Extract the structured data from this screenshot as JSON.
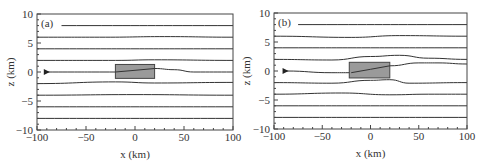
{
  "chart_data": [
    {
      "type": "line",
      "panel_label": "(a)",
      "xlabel": "x (km)",
      "ylabel": "z (km)",
      "xlim": [
        -100,
        100
      ],
      "ylim": [
        -10,
        10
      ],
      "xticks": [
        -100,
        -50,
        0,
        50,
        100
      ],
      "xtick_labels": [
        "−100",
        "−50",
        "0",
        "50",
        "100"
      ],
      "yticks": [
        -10,
        -5,
        0,
        5,
        10
      ],
      "ytick_labels": [
        "−10",
        "−5",
        "0",
        "5",
        "10"
      ],
      "grid": false,
      "obstacle": {
        "x0": -20,
        "x1": 20,
        "z0": -1.1,
        "z1": 1.3,
        "color": "#999999"
      },
      "source_marker": {
        "x": -90,
        "z": 0
      },
      "series": [
        {
          "name": "streamline z=8",
          "points": [
            [
              -75,
              8
            ],
            [
              100,
              8
            ]
          ]
        },
        {
          "name": "streamline z=6",
          "points": [
            [
              -100,
              6
            ],
            [
              -30,
              6
            ],
            [
              30,
              6.1
            ],
            [
              100,
              6
            ]
          ]
        },
        {
          "name": "streamline z=4",
          "points": [
            [
              -100,
              4
            ],
            [
              100,
              4
            ]
          ]
        },
        {
          "name": "streamline z=2",
          "points": [
            [
              -100,
              2
            ],
            [
              -20,
              2
            ],
            [
              20,
              2.1
            ],
            [
              100,
              2
            ]
          ]
        },
        {
          "name": "streamline z=0",
          "points": [
            [
              -90,
              0
            ],
            [
              -20,
              0
            ],
            [
              0,
              0.3
            ],
            [
              20,
              0.6
            ],
            [
              40,
              0.4
            ],
            [
              60,
              0
            ],
            [
              100,
              0
            ]
          ]
        },
        {
          "name": "streamline z=-2",
          "points": [
            [
              -100,
              -2
            ],
            [
              -20,
              -1.7
            ],
            [
              20,
              -1.9
            ],
            [
              100,
              -1.8
            ]
          ]
        },
        {
          "name": "streamline z=-4",
          "points": [
            [
              -100,
              -4
            ],
            [
              0,
              -3.9
            ],
            [
              100,
              -4
            ]
          ]
        },
        {
          "name": "streamline z=-6",
          "points": [
            [
              -100,
              -6
            ],
            [
              100,
              -6
            ]
          ]
        },
        {
          "name": "streamline z=-8",
          "points": [
            [
              -100,
              -8
            ],
            [
              100,
              -8
            ]
          ]
        }
      ]
    },
    {
      "type": "line",
      "panel_label": "(b)",
      "xlabel": "x (km)",
      "ylabel": "z (km)",
      "xlim": [
        -100,
        100
      ],
      "ylim": [
        -10,
        10
      ],
      "xticks": [
        -100,
        -50,
        0,
        50,
        100
      ],
      "xtick_labels": [
        "−100",
        "−50",
        "0",
        "50",
        "100"
      ],
      "yticks": [
        -10,
        -5,
        0,
        5,
        10
      ],
      "ytick_labels": [
        "−10",
        "−5",
        "0",
        "5",
        "10"
      ],
      "grid": false,
      "obstacle": {
        "x0": -22,
        "x1": 20,
        "z0": -1.2,
        "z1": 1.5,
        "color": "#999999"
      },
      "source_marker": {
        "x": -88,
        "z": 0
      },
      "series": [
        {
          "name": "streamline z=8",
          "points": [
            [
              -75,
              8
            ],
            [
              100,
              8
            ]
          ]
        },
        {
          "name": "streamline z=6",
          "points": [
            [
              -100,
              6
            ],
            [
              -20,
              5.8
            ],
            [
              30,
              6.1
            ],
            [
              100,
              6
            ]
          ]
        },
        {
          "name": "streamline z=4",
          "points": [
            [
              -100,
              4
            ],
            [
              100,
              4
            ]
          ]
        },
        {
          "name": "streamline z=2",
          "points": [
            [
              -100,
              2
            ],
            [
              -40,
              1.9
            ],
            [
              0,
              2.5
            ],
            [
              30,
              2.7
            ],
            [
              60,
              2.2
            ],
            [
              100,
              2
            ]
          ]
        },
        {
          "name": "streamline z=0",
          "points": [
            [
              -88,
              0
            ],
            [
              -40,
              -0.3
            ],
            [
              -20,
              -0.3
            ],
            [
              0,
              0.3
            ],
            [
              20,
              0.9
            ],
            [
              50,
              1.4
            ],
            [
              70,
              1.4
            ],
            [
              100,
              1.2
            ]
          ]
        },
        {
          "name": "streamline z=-2",
          "points": [
            [
              -100,
              -2
            ],
            [
              -40,
              -2.1
            ],
            [
              0,
              -1.6
            ],
            [
              20,
              -1.5
            ],
            [
              40,
              -2.1
            ],
            [
              100,
              -2
            ]
          ]
        },
        {
          "name": "streamline z=-4",
          "points": [
            [
              -100,
              -4
            ],
            [
              -30,
              -3.8
            ],
            [
              20,
              -4.1
            ],
            [
              60,
              -4
            ],
            [
              100,
              -4
            ]
          ]
        },
        {
          "name": "streamline z=-6",
          "points": [
            [
              -100,
              -6
            ],
            [
              100,
              -6
            ]
          ]
        },
        {
          "name": "streamline z=-8",
          "points": [
            [
              -100,
              -8
            ],
            [
              100,
              -8
            ]
          ]
        }
      ]
    }
  ],
  "style": {
    "line_color": "#333333",
    "frame_color": "#444444",
    "obstacle_fill": "#9a9a9a",
    "obstacle_stroke": "#444444"
  }
}
